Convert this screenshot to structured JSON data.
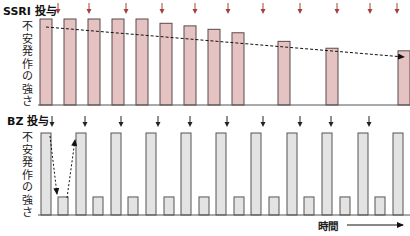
{
  "ssri": {
    "label": "SSRI 投与",
    "ylabel": [
      "不",
      "安",
      "発",
      "作",
      "の",
      "強",
      "さ"
    ],
    "bar_color": "#e6c3c3",
    "bar_stroke": "#5a4a4a",
    "arrow_color": "#a5403d",
    "dose_arrows_x": [
      58,
      89,
      126,
      162,
      195,
      228,
      263,
      300,
      337,
      370,
      397
    ],
    "bars": [
      {
        "x": 40,
        "h": 100
      },
      {
        "x": 64,
        "h": 100
      },
      {
        "x": 88,
        "h": 100
      },
      {
        "x": 112,
        "h": 100
      },
      {
        "x": 136,
        "h": 100
      },
      {
        "x": 160,
        "h": 95
      },
      {
        "x": 184,
        "h": 92
      },
      {
        "x": 208,
        "h": 88
      },
      {
        "x": 232,
        "h": 84
      },
      {
        "x": 278,
        "h": 74
      },
      {
        "x": 326,
        "h": 66
      },
      {
        "x": 398,
        "h": 63
      }
    ],
    "trend": "declining"
  },
  "bz": {
    "label": "BZ 投与",
    "ylabel": [
      "不",
      "安",
      "発",
      "作",
      "の",
      "強",
      "さ"
    ],
    "bar_color": "#e3e3e3",
    "bar_stroke": "#555555",
    "arrow_color": "#222222",
    "dose_arrows_x": [
      52,
      85,
      121,
      158,
      190,
      227,
      263,
      300,
      331,
      369
    ],
    "bars": [
      {
        "x": 41,
        "h": 100
      },
      {
        "x": 58,
        "h": 22
      },
      {
        "x": 76,
        "h": 100
      },
      {
        "x": 93,
        "h": 22
      },
      {
        "x": 111,
        "h": 100
      },
      {
        "x": 128,
        "h": 22
      },
      {
        "x": 146,
        "h": 100
      },
      {
        "x": 164,
        "h": 22
      },
      {
        "x": 181,
        "h": 100
      },
      {
        "x": 199,
        "h": 22
      },
      {
        "x": 216,
        "h": 100
      },
      {
        "x": 234,
        "h": 22
      },
      {
        "x": 251,
        "h": 100
      },
      {
        "x": 269,
        "h": 22
      },
      {
        "x": 287,
        "h": 100
      },
      {
        "x": 304,
        "h": 22
      },
      {
        "x": 322,
        "h": 100
      },
      {
        "x": 340,
        "h": 22
      },
      {
        "x": 358,
        "h": 100
      },
      {
        "x": 375,
        "h": 22
      },
      {
        "x": 393,
        "h": 100
      }
    ],
    "trend": "oscillating"
  },
  "xaxis": {
    "label": "時間"
  },
  "chart_data": [
    {
      "type": "bar",
      "title": "SSRI 投与",
      "ylabel": "不安発作の強さ",
      "xlabel": "時間",
      "values": [
        100,
        100,
        100,
        100,
        100,
        95,
        92,
        88,
        84,
        74,
        66,
        63
      ],
      "annotations": [
        "dashed declining trend arrow",
        "red dose arrows at top"
      ]
    },
    {
      "type": "bar",
      "title": "BZ 投与",
      "ylabel": "不安発作の強さ",
      "xlabel": "時間",
      "values": [
        100,
        22,
        100,
        22,
        100,
        22,
        100,
        22,
        100,
        22,
        100,
        22,
        100,
        22,
        100,
        22,
        100,
        22,
        100,
        22,
        100
      ],
      "annotations": [
        "dashed down/up arrows between first bars",
        "black dose arrows at top"
      ]
    }
  ]
}
